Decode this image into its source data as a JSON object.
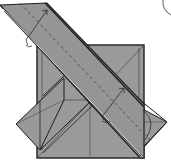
{
  "diagram": {
    "type": "origami-folding-step",
    "colors": {
      "paper": "#9a9a9a",
      "paper_dark": "#8c8c8c",
      "edge": "#1e1e1e",
      "crease": "#3a3a3a",
      "valley_fold": "#4a4a4a",
      "arrow": "#2a2a2a",
      "background": "#ffffff"
    },
    "elements": [
      {
        "id": "square-base",
        "label": "square base"
      },
      {
        "id": "left-flap",
        "label": "left triangular flap"
      },
      {
        "id": "right-flap",
        "label": "right triangular flap"
      },
      {
        "id": "diagonal-strip",
        "label": "diagonal folded strip"
      },
      {
        "id": "fold-arrow-upper",
        "label": "upper fold arrow"
      },
      {
        "id": "fold-arrow-lower",
        "label": "lower fold arrow"
      },
      {
        "id": "valley-fold-line",
        "label": "dashed valley fold line"
      },
      {
        "id": "rotation-arc",
        "label": "arc at top-right"
      }
    ]
  }
}
